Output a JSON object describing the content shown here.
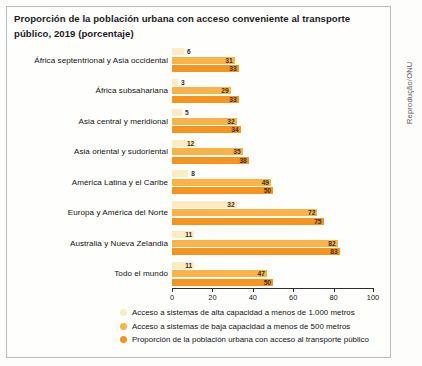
{
  "credit": "Reprodução/ONU",
  "title": "Proporción de la población urbana con acceso conveniente al transporte público, 2019 (porcentaje)",
  "colors": {
    "series_high_capacity": "#fdebc4",
    "series_low_capacity": "#f9b348",
    "series_total_access": "#f5941f",
    "axis": "#2b2c2e",
    "frame": "#b9bcbe",
    "text": "#121314"
  },
  "legend": {
    "position": "bottom",
    "items": [
      {
        "label": "Acceso a sistemas de alta capacidad a menos de 1.000 metros",
        "color": "#fdebc4"
      },
      {
        "label": "Acceso a sistemas de baja capacidad a menos de 500 metros",
        "color": "#f9b348"
      },
      {
        "label": "Proporción de la población urbana con acceso al transporte público",
        "color": "#f5941f"
      }
    ]
  },
  "axis": {
    "ticks": [
      "0",
      "20",
      "40",
      "60",
      "80",
      "100"
    ]
  },
  "chart_data": {
    "type": "bar",
    "orientation": "horizontal",
    "title": "Proporción de la población urbana con acceso conveniente al transporte público, 2019 (porcentaje)",
    "xlabel": "",
    "ylabel": "",
    "xlim": [
      0,
      100
    ],
    "grid": false,
    "legend_position": "bottom",
    "categories": [
      "África septentrional y Asia occidental",
      "África subsahariana",
      "Asia central y meridional",
      "Asia oriental y sudoriental",
      "América Latina y el Caribe",
      "Europa y América del Norte",
      "Australia y Nueva Zelandia",
      "Todo el mundo"
    ],
    "series": [
      {
        "name": "Acceso a sistemas de alta capacidad a menos de 1.000 metros",
        "color": "#fdebc4",
        "values": [
          6,
          3,
          5,
          12,
          8,
          32,
          11,
          11
        ]
      },
      {
        "name": "Acceso a sistemas de baja capacidad a menos de 500 metros",
        "color": "#f9b348",
        "values": [
          31,
          29,
          32,
          35,
          49,
          72,
          82,
          47
        ]
      },
      {
        "name": "Proporción de la población urbana con acceso al transporte público",
        "color": "#f5941f",
        "values": [
          33,
          33,
          34,
          38,
          50,
          75,
          83,
          50
        ]
      }
    ]
  }
}
